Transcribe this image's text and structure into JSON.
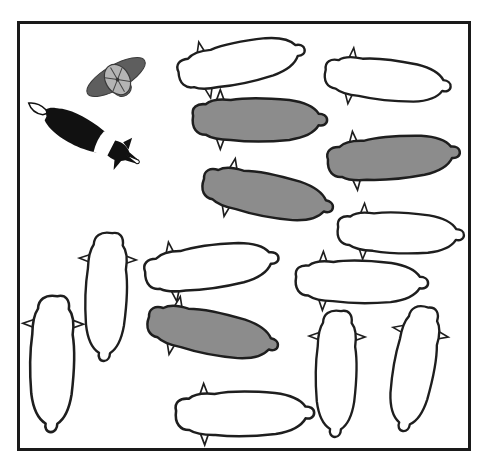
{
  "scene": {
    "description": "Top-down illustration of a shepherd, a sheepdog and a flock of sheep inside a square frame",
    "colors": {
      "frame": "#1a1a1a",
      "white_sheep_fill": "#ffffff",
      "gray_sheep_fill": "#8c8c8c",
      "outline": "#1e1e1e",
      "hat_brim": "#5e5e5e",
      "hat_crown": "#b4b4b4",
      "dog_black": "#111111"
    },
    "shepherd": {
      "label": "shepherd",
      "x": 116,
      "y": 77,
      "angle": -30
    },
    "dog": {
      "label": "sheepdog",
      "x": 83,
      "y": 133,
      "angle": 27
    },
    "sheep": [
      {
        "id": 1,
        "fill": "white",
        "x": 240,
        "y": 63,
        "angle": -12,
        "len": 128
      },
      {
        "id": 2,
        "fill": "white",
        "x": 386,
        "y": 80,
        "angle": 6,
        "len": 126
      },
      {
        "id": 3,
        "fill": "gray",
        "x": 258,
        "y": 120,
        "angle": 0,
        "len": 134
      },
      {
        "id": 4,
        "fill": "gray",
        "x": 392,
        "y": 158,
        "angle": -5,
        "len": 132
      },
      {
        "id": 5,
        "fill": "gray",
        "x": 266,
        "y": 195,
        "angle": 11,
        "len": 132
      },
      {
        "id": 6,
        "fill": "white",
        "x": 399,
        "y": 233,
        "angle": 2,
        "len": 126
      },
      {
        "id": 7,
        "fill": "white",
        "x": 210,
        "y": 267,
        "angle": -8,
        "len": 134
      },
      {
        "id": 8,
        "fill": "white",
        "x": 360,
        "y": 282,
        "angle": 1,
        "len": 132
      },
      {
        "id": 9,
        "fill": "gray",
        "x": 211,
        "y": 333,
        "angle": 11,
        "len": 132
      },
      {
        "id": 10,
        "fill": "white",
        "x": 243,
        "y": 414,
        "angle": -1,
        "len": 138
      },
      {
        "id": 11,
        "fill": "white",
        "x": 106,
        "y": 295,
        "angle": 92,
        "len": 128
      },
      {
        "id": 12,
        "fill": "white",
        "x": 52,
        "y": 362,
        "angle": 91,
        "len": 136
      },
      {
        "id": 13,
        "fill": "white",
        "x": 336,
        "y": 372,
        "angle": 91,
        "len": 126
      },
      {
        "id": 14,
        "fill": "white",
        "x": 414,
        "y": 367,
        "angle": 100,
        "len": 126
      }
    ]
  }
}
